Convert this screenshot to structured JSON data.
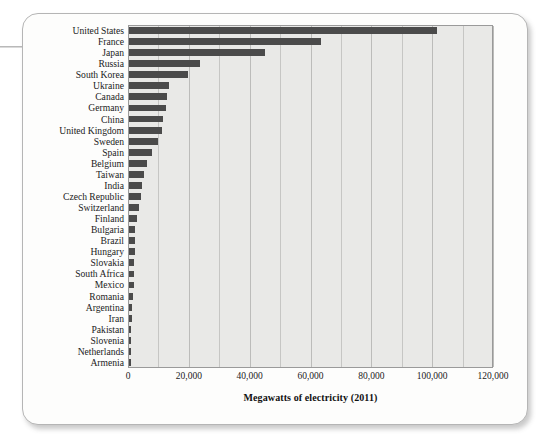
{
  "figure": {
    "bar_color": "#4b4b4b",
    "plot_background": "#e9e9e7",
    "card_background": "#fdfdfc",
    "grid_color": "#c6c6c4",
    "axis_color": "#9a9a9a"
  },
  "chart_data": {
    "type": "bar",
    "orientation": "horizontal",
    "title": "",
    "subtitle": "",
    "xlabel": "Megawatts of electricity (2011)",
    "ylabel": "",
    "xlim": [
      0,
      120000
    ],
    "xticks": [
      0,
      20000,
      40000,
      60000,
      80000,
      100000,
      120000
    ],
    "xtick_labels": [
      "0",
      "20,000",
      "40,000",
      "60,000",
      "80,000",
      "100,000",
      "120,000"
    ],
    "minor_gridline_step": 10000,
    "grid": true,
    "legend": false,
    "categories": [
      "United States",
      "France",
      "Japan",
      "Russia",
      "South Korea",
      "Ukraine",
      "Canada",
      "Germany",
      "China",
      "United Kingdom",
      "Sweden",
      "Spain",
      "Belgium",
      "Taiwan",
      "India",
      "Czech Republic",
      "Switzerland",
      "Finland",
      "Bulgaria",
      "Brazil",
      "Hungary",
      "Slovakia",
      "South Africa",
      "Mexico",
      "Romania",
      "Argentina",
      "Iran",
      "Pakistan",
      "Slovenia",
      "Netherlands",
      "Armenia"
    ],
    "values": [
      101400,
      63100,
      44600,
      23300,
      19300,
      13100,
      12600,
      12100,
      11300,
      10700,
      9400,
      7600,
      6000,
      5000,
      4400,
      3900,
      3300,
      2700,
      2000,
      1900,
      1900,
      1800,
      1800,
      1600,
      1400,
      1000,
      920,
      730,
      690,
      510,
      380
    ]
  }
}
